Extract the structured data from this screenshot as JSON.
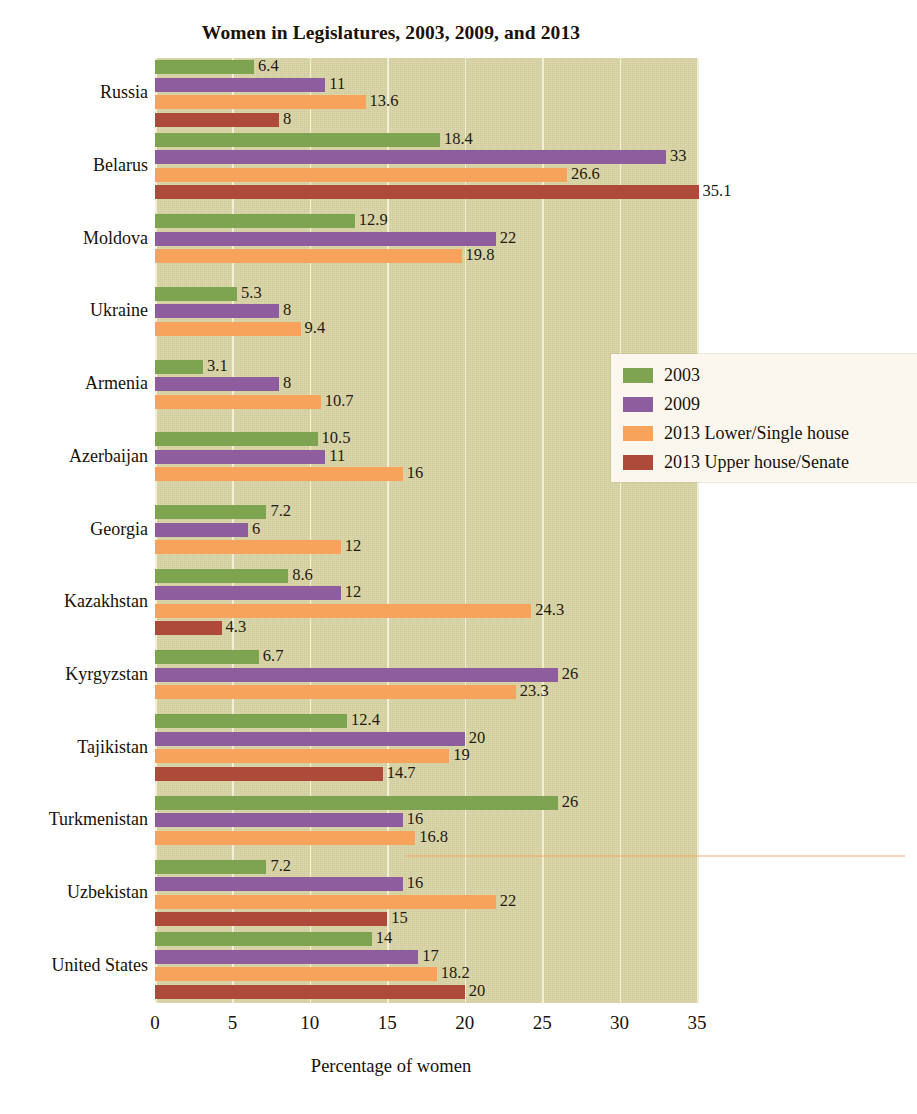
{
  "chart_data": {
    "type": "bar",
    "orientation": "horizontal",
    "title": "Women in Legislatures, 2003, 2009, and 2013",
    "xlabel": "Percentage of women",
    "ylabel": "",
    "xlim": [
      0,
      35
    ],
    "xticks": [
      0,
      5,
      10,
      15,
      20,
      25,
      30,
      35
    ],
    "xtick_labels": [
      "0",
      "5",
      "10",
      "15",
      "20",
      "25",
      "30",
      "35"
    ],
    "grid": true,
    "legend_position": "center-right",
    "categories": [
      "Russia",
      "Belarus",
      "Moldova",
      "Ukraine",
      "Armenia",
      "Azerbaijan",
      "Georgia",
      "Kazakhstan",
      "Kyrgyzstan",
      "Tajikistan",
      "Turkmenistan",
      "Uzbekistan",
      "United States"
    ],
    "series": [
      {
        "name": "2003",
        "color": "#7ea351",
        "values": [
          6.4,
          18.4,
          12.9,
          5.3,
          3.1,
          10.5,
          7.2,
          8.6,
          6.7,
          12.4,
          26,
          7.2,
          14
        ],
        "labels": [
          "6.4",
          "18.4",
          "12.9",
          "5.3",
          "3.1",
          "10.5",
          "7.2",
          "8.6",
          "6.7",
          "12.4",
          "26",
          "7.2",
          "14"
        ]
      },
      {
        "name": "2009",
        "color": "#8e5d9d",
        "values": [
          11,
          33,
          22,
          8,
          8,
          11,
          6,
          12,
          26,
          20,
          16,
          16,
          17
        ],
        "labels": [
          "11",
          "33",
          "22",
          "8",
          "8",
          "11",
          "6",
          "12",
          "26",
          "20",
          "16",
          "16",
          "17"
        ]
      },
      {
        "name": "2013 Lower/Single house",
        "color": "#f7a35c",
        "values": [
          13.6,
          26.6,
          19.8,
          9.4,
          10.7,
          16,
          12,
          24.3,
          23.3,
          19,
          16.8,
          22,
          18.2
        ],
        "labels": [
          "13.6",
          "26.6",
          "19.8",
          "9.4",
          "10.7",
          "16",
          "12",
          "24.3",
          "23.3",
          "19",
          "16.8",
          "22",
          "18.2"
        ]
      },
      {
        "name": "2013 Upper house/Senate",
        "color": "#ae4a3a",
        "values": [
          8,
          35.1,
          null,
          null,
          null,
          null,
          null,
          4.3,
          null,
          14.7,
          null,
          15,
          20
        ],
        "labels": [
          "8",
          "35.1",
          "",
          "",
          "",
          "",
          "",
          "4.3",
          "",
          "14.7",
          "",
          "15",
          "20"
        ]
      }
    ]
  },
  "legend": {
    "items": [
      {
        "label": "2003",
        "swatch": "s2003"
      },
      {
        "label": "2009",
        "swatch": "s2009"
      },
      {
        "label": "2013 Lower/Single house",
        "swatch": "s2013l"
      },
      {
        "label": "2013 Upper house/Senate",
        "swatch": "s2013u"
      }
    ]
  },
  "colors": {
    "series_2003": "#7ea351",
    "series_2009": "#8e5d9d",
    "series_2013_lower": "#f7a35c",
    "series_2013_upper": "#ae4a3a",
    "plot_background": "#d9d4a4",
    "gridline": "#f3efd6",
    "legend_background": "#fbf7ef",
    "text": "#191107"
  }
}
